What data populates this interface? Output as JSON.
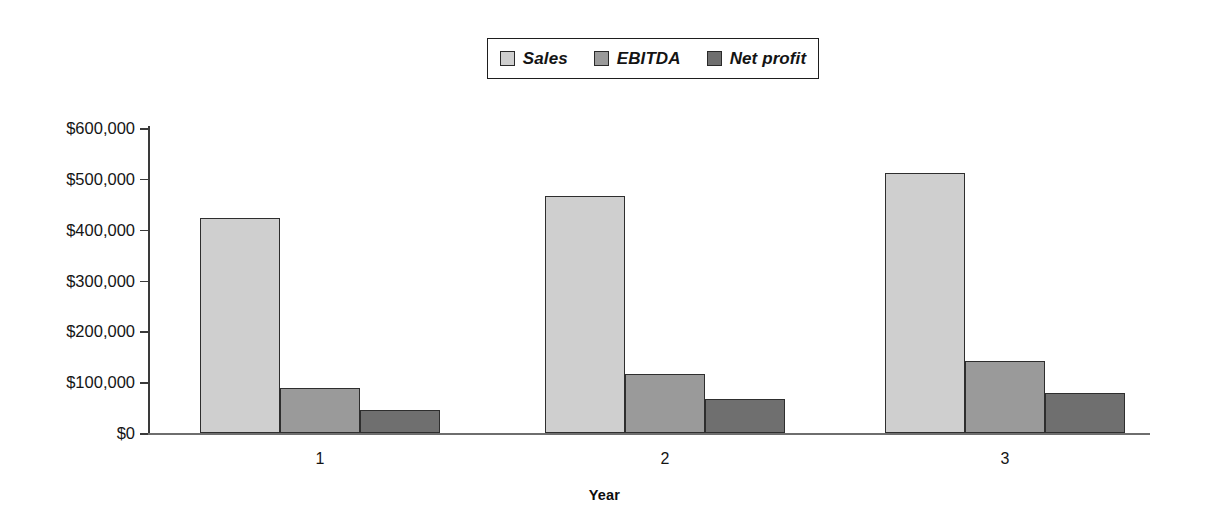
{
  "chart_data": {
    "type": "bar",
    "title": "",
    "xlabel": "Year",
    "ylabel": "",
    "categories": [
      "1",
      "2",
      "3"
    ],
    "series": [
      {
        "name": "Sales",
        "values": [
          423000,
          466000,
          511000
        ],
        "color": "#cfcfcf"
      },
      {
        "name": "EBITDA",
        "values": [
          88000,
          116000,
          142000
        ],
        "color": "#9a9a9a"
      },
      {
        "name": "Net profit",
        "values": [
          45000,
          66000,
          79000
        ],
        "color": "#6f6f6f"
      }
    ],
    "ylim": [
      0,
      600000
    ],
    "ytick_values": [
      0,
      100000,
      200000,
      300000,
      400000,
      500000,
      600000
    ],
    "ytick_labels": [
      "$0",
      "$100,000",
      "$200,000",
      "$300,000",
      "$400,000",
      "$500,000",
      "$600,000"
    ],
    "grid": false,
    "legend_position": "top-center",
    "legend_italic": true
  },
  "legend": {
    "entries": [
      {
        "label": "Sales"
      },
      {
        "label": "EBITDA"
      },
      {
        "label": "Net profit"
      }
    ]
  },
  "axes": {
    "x_title": "Year"
  }
}
